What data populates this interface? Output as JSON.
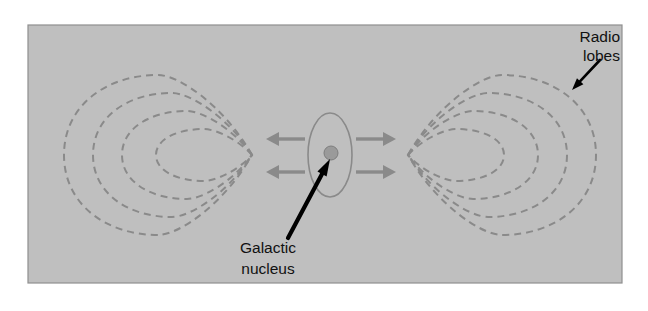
{
  "figure": {
    "panel": {
      "background_color": "#bfbfbf",
      "border_color": "#8f8f8f",
      "x": 28,
      "y": 25,
      "width": 594,
      "height": 258
    },
    "page_background": "#ffffff"
  },
  "colors": {
    "panel_fill": "#bfbfbf",
    "panel_border": "#8f8f8f",
    "contour_dashed": "#8a8a8a",
    "jet_arrow": "#8a8a8a",
    "galaxy_outline": "#8a8a8a",
    "nucleus_dot": "#9a9a9a",
    "nucleus_dot_outline": "#7d7d7d",
    "pointer_arrow": "#000000",
    "label_text": "#111111"
  },
  "labels": [
    {
      "name": "radio-lobes-label",
      "lines": [
        "Radio",
        "lobes"
      ],
      "line1": "Radio",
      "line2": "lobes",
      "align": "right",
      "x": 620,
      "y": 42,
      "pointer": {
        "from_x": 600,
        "from_y": 60,
        "to_x": 572,
        "to_y": 90
      }
    },
    {
      "name": "galactic-nucleus-label",
      "lines": [
        "Galactic",
        "nucleus"
      ],
      "line1": "Galactic",
      "line2": "nucleus",
      "align": "center",
      "x": 268,
      "y": 253,
      "pointer": {
        "from_x": 288,
        "from_y": 238,
        "to_x": 330,
        "to_y": 159
      }
    }
  ],
  "galaxy": {
    "name": "galactic-nucleus",
    "ellipse": {
      "cx": 330,
      "cy": 155,
      "rx": 22,
      "ry": 42
    },
    "nucleus": {
      "cx": 331,
      "cy": 153,
      "r": 7
    }
  },
  "jets": {
    "name": "jet-arrows",
    "count": 4,
    "arrows": [
      {
        "name": "jet-arrow-upper-left",
        "direction": "left",
        "x1": 305,
        "y1": 139,
        "x2": 266,
        "y2": 139
      },
      {
        "name": "jet-arrow-lower-left",
        "direction": "left",
        "x1": 305,
        "y1": 172,
        "x2": 266,
        "y2": 172
      },
      {
        "name": "jet-arrow-upper-right",
        "direction": "right",
        "x1": 356,
        "y1": 139,
        "x2": 396,
        "y2": 139
      },
      {
        "name": "jet-arrow-lower-right",
        "direction": "right",
        "x1": 356,
        "y1": 172,
        "x2": 396,
        "y2": 172
      }
    ]
  },
  "lobes": [
    {
      "name": "radio-lobe-left",
      "side": "left",
      "cusp_x": 252,
      "cusp_y": 155,
      "contour_count": 4,
      "contours": [
        {
          "index": 1,
          "far_x": 156,
          "rx": 48,
          "ry": 26
        },
        {
          "index": 2,
          "far_x": 122,
          "rx": 65,
          "ry": 44
        },
        {
          "index": 3,
          "far_x": 93,
          "rx": 80,
          "ry": 62
        },
        {
          "index": 4,
          "far_x": 64,
          "rx": 94,
          "ry": 80
        }
      ]
    },
    {
      "name": "radio-lobe-right",
      "side": "right",
      "cusp_x": 408,
      "cusp_y": 155,
      "contour_count": 4,
      "contours": [
        {
          "index": 1,
          "far_x": 504,
          "rx": 48,
          "ry": 26
        },
        {
          "index": 2,
          "far_x": 538,
          "rx": 65,
          "ry": 44
        },
        {
          "index": 3,
          "far_x": 567,
          "rx": 80,
          "ry": 62
        },
        {
          "index": 4,
          "far_x": 596,
          "rx": 94,
          "ry": 80
        }
      ]
    }
  ]
}
